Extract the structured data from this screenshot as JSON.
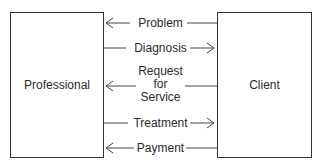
{
  "diagram": {
    "nodes": [
      {
        "id": "professional",
        "label": "Professional"
      },
      {
        "id": "client",
        "label": "Client"
      }
    ],
    "flows": [
      {
        "label": "Problem",
        "direction": "client-to-professional",
        "y": 23
      },
      {
        "label": "Diagnosis",
        "direction": "professional-to-client",
        "y": 48
      },
      {
        "label": "Request\nfor\nService",
        "lines": [
          "Request",
          "for",
          "Service"
        ],
        "direction": "client-to-professional",
        "y": 85
      },
      {
        "label": "Treatment",
        "direction": "professional-to-client",
        "y": 123
      },
      {
        "label": "Payment",
        "direction": "client-to-professional",
        "y": 148
      }
    ],
    "colors": {
      "line": "#333333",
      "text": "#2a2a2a",
      "background": "#ffffff"
    }
  }
}
